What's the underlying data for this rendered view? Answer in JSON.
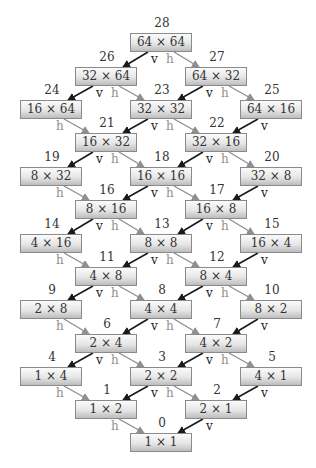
{
  "diagram": {
    "edge_labels": {
      "vertical": "v",
      "horizontal": "h"
    },
    "colors": {
      "v_arrow": "#1a1a1a",
      "h_arrow": "#8f8f8f",
      "box_border": "#8a8a8a"
    },
    "nodes": [
      {
        "id": "28",
        "label": "64 × 64",
        "row": 0,
        "col": 2
      },
      {
        "id": "26",
        "label": "32 × 64",
        "row": 1,
        "col": 1
      },
      {
        "id": "27",
        "label": "64 × 32",
        "row": 1,
        "col": 3
      },
      {
        "id": "24",
        "label": "16 × 64",
        "row": 2,
        "col": 0
      },
      {
        "id": "23",
        "label": "32 × 32",
        "row": 2,
        "col": 2
      },
      {
        "id": "25",
        "label": "64 × 16",
        "row": 2,
        "col": 4
      },
      {
        "id": "21",
        "label": "16 × 32",
        "row": 3,
        "col": 1
      },
      {
        "id": "22",
        "label": "32 × 16",
        "row": 3,
        "col": 3
      },
      {
        "id": "19",
        "label": "8 × 32",
        "row": 4,
        "col": 0
      },
      {
        "id": "18",
        "label": "16 × 16",
        "row": 4,
        "col": 2
      },
      {
        "id": "20",
        "label": "32 × 8",
        "row": 4,
        "col": 4
      },
      {
        "id": "16",
        "label": "8 × 16",
        "row": 5,
        "col": 1
      },
      {
        "id": "17",
        "label": "16 × 8",
        "row": 5,
        "col": 3
      },
      {
        "id": "14",
        "label": "4 × 16",
        "row": 6,
        "col": 0
      },
      {
        "id": "13",
        "label": "8 × 8",
        "row": 6,
        "col": 2
      },
      {
        "id": "15",
        "label": "16 × 4",
        "row": 6,
        "col": 4
      },
      {
        "id": "11",
        "label": "4 × 8",
        "row": 7,
        "col": 1
      },
      {
        "id": "12",
        "label": "8 × 4",
        "row": 7,
        "col": 3
      },
      {
        "id": "9",
        "label": "2 × 8",
        "row": 8,
        "col": 0
      },
      {
        "id": "8",
        "label": "4 × 4",
        "row": 8,
        "col": 2
      },
      {
        "id": "10",
        "label": "8 × 2",
        "row": 8,
        "col": 4
      },
      {
        "id": "6",
        "label": "2 × 4",
        "row": 9,
        "col": 1
      },
      {
        "id": "7",
        "label": "4 × 2",
        "row": 9,
        "col": 3
      },
      {
        "id": "4",
        "label": "1 × 4",
        "row": 10,
        "col": 0
      },
      {
        "id": "3",
        "label": "2 × 2",
        "row": 10,
        "col": 2
      },
      {
        "id": "5",
        "label": "4 × 1",
        "row": 10,
        "col": 4
      },
      {
        "id": "1",
        "label": "1 × 2",
        "row": 11,
        "col": 1
      },
      {
        "id": "2",
        "label": "2 × 1",
        "row": 11,
        "col": 3
      },
      {
        "id": "0",
        "label": "1 × 1",
        "row": 12,
        "col": 2
      }
    ],
    "edges": [
      {
        "from": "28",
        "to": "26",
        "type": "v"
      },
      {
        "from": "28",
        "to": "27",
        "type": "h"
      },
      {
        "from": "26",
        "to": "24",
        "type": "v"
      },
      {
        "from": "26",
        "to": "23",
        "type": "h"
      },
      {
        "from": "27",
        "to": "23",
        "type": "v"
      },
      {
        "from": "27",
        "to": "25",
        "type": "h"
      },
      {
        "from": "24",
        "to": "21",
        "type": "h"
      },
      {
        "from": "23",
        "to": "21",
        "type": "v"
      },
      {
        "from": "23",
        "to": "22",
        "type": "h"
      },
      {
        "from": "25",
        "to": "22",
        "type": "v"
      },
      {
        "from": "21",
        "to": "19",
        "type": "v"
      },
      {
        "from": "21",
        "to": "18",
        "type": "h"
      },
      {
        "from": "22",
        "to": "18",
        "type": "v"
      },
      {
        "from": "22",
        "to": "20",
        "type": "h"
      },
      {
        "from": "19",
        "to": "16",
        "type": "h"
      },
      {
        "from": "18",
        "to": "16",
        "type": "v"
      },
      {
        "from": "18",
        "to": "17",
        "type": "h"
      },
      {
        "from": "20",
        "to": "17",
        "type": "v"
      },
      {
        "from": "16",
        "to": "14",
        "type": "v"
      },
      {
        "from": "16",
        "to": "13",
        "type": "h"
      },
      {
        "from": "17",
        "to": "13",
        "type": "v"
      },
      {
        "from": "17",
        "to": "15",
        "type": "h"
      },
      {
        "from": "14",
        "to": "11",
        "type": "h"
      },
      {
        "from": "13",
        "to": "11",
        "type": "v"
      },
      {
        "from": "13",
        "to": "12",
        "type": "h"
      },
      {
        "from": "15",
        "to": "12",
        "type": "v"
      },
      {
        "from": "11",
        "to": "9",
        "type": "v"
      },
      {
        "from": "11",
        "to": "8",
        "type": "h"
      },
      {
        "from": "12",
        "to": "8",
        "type": "v"
      },
      {
        "from": "12",
        "to": "10",
        "type": "h"
      },
      {
        "from": "9",
        "to": "6",
        "type": "h"
      },
      {
        "from": "8",
        "to": "6",
        "type": "v"
      },
      {
        "from": "8",
        "to": "7",
        "type": "h"
      },
      {
        "from": "10",
        "to": "7",
        "type": "v"
      },
      {
        "from": "6",
        "to": "4",
        "type": "v"
      },
      {
        "from": "6",
        "to": "3",
        "type": "h"
      },
      {
        "from": "7",
        "to": "3",
        "type": "v"
      },
      {
        "from": "7",
        "to": "5",
        "type": "h"
      },
      {
        "from": "4",
        "to": "1",
        "type": "h"
      },
      {
        "from": "3",
        "to": "1",
        "type": "v"
      },
      {
        "from": "3",
        "to": "2",
        "type": "h"
      },
      {
        "from": "5",
        "to": "2",
        "type": "v"
      },
      {
        "from": "1",
        "to": "0",
        "type": "h"
      },
      {
        "from": "2",
        "to": "0",
        "type": "v"
      }
    ]
  }
}
